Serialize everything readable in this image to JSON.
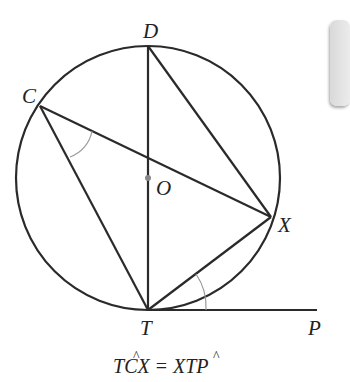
{
  "diagram": {
    "type": "circle-theorem",
    "theorem": "tangent-chord angle equals angle in alternate segment",
    "circle": {
      "center_label": "O",
      "center": [
        148,
        178
      ],
      "radius": 132
    },
    "points": {
      "D": {
        "label": "D",
        "pos": [
          148,
          46
        ]
      },
      "C": {
        "label": "C",
        "pos": [
          40,
          106
        ]
      },
      "O": {
        "label": "O",
        "pos": [
          148,
          178
        ]
      },
      "X": {
        "label": "X",
        "pos": [
          271,
          217
        ]
      },
      "T": {
        "label": "T",
        "pos": [
          148,
          310
        ]
      },
      "P": {
        "label": "P",
        "pos": [
          317,
          310
        ]
      }
    },
    "segments": [
      "DT",
      "DX",
      "CX",
      "CT",
      "TX",
      "TP"
    ],
    "marked_angles": [
      "TCX",
      "XTP"
    ],
    "caption": {
      "lhs_pre": "T",
      "lhs_hat": "C",
      "lhs_post": "X",
      "equals": "=",
      "rhs_pre": "X",
      "rhs_hat": "T",
      "rhs_post": "P"
    },
    "colors": {
      "line": "#2a2a2a",
      "arc_mark": "#999999",
      "center_dot": "#888888"
    }
  }
}
